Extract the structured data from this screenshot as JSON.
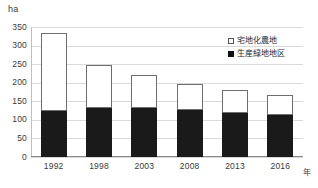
{
  "chart_data": {
    "type": "bar",
    "stacked": true,
    "title": "",
    "subtitle": "",
    "xlabel": "年",
    "ylabel": "ha",
    "categories": [
      "1992",
      "1998",
      "2003",
      "2008",
      "2013",
      "2016"
    ],
    "series": [
      {
        "name": "生産緑地地区",
        "values": [
          125,
          131,
          131,
          126,
          118,
          113
        ],
        "color": "#1a1a1a",
        "swatch": "filled-square"
      },
      {
        "name": "宅地化農地",
        "values": [
          210,
          118,
          89,
          71,
          62,
          53
        ],
        "color": "#ffffff",
        "swatch": "open-square"
      }
    ],
    "totals": [
      335,
      249,
      220,
      197,
      180,
      166
    ],
    "ylim": [
      0,
      350
    ],
    "yticks": [
      "0",
      "50",
      "100",
      "150",
      "200",
      "250",
      "300",
      "350"
    ],
    "ytick_values": [
      0,
      50,
      100,
      150,
      200,
      250,
      300,
      350
    ],
    "grid": true,
    "legend_position": "top-right",
    "legend_order": [
      "宅地化農地",
      "生産緑地地区"
    ]
  },
  "axes": {
    "unit_label": "ha",
    "x_axis_title": "年"
  },
  "legend": {
    "items": [
      {
        "label": "宅地化農地",
        "swatch": "open-square"
      },
      {
        "label": "生産緑地地区",
        "swatch": "filled-square"
      }
    ]
  }
}
